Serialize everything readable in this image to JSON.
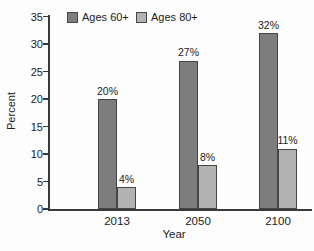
{
  "chart_data": {
    "type": "bar",
    "title": "",
    "xlabel": "Year",
    "ylabel": "Percent",
    "categories": [
      "2013",
      "2050",
      "2100"
    ],
    "series": [
      {
        "name": "Ages 60+",
        "values": [
          20,
          27,
          32
        ],
        "labels": [
          "20%",
          "27%",
          "32%"
        ],
        "color": "#7d7d7d"
      },
      {
        "name": "Ages 80+",
        "values": [
          4,
          8,
          11
        ],
        "labels": [
          "4%",
          "8%",
          "11%"
        ],
        "color": "#b2b2b2"
      }
    ],
    "ylim": [
      0,
      35
    ],
    "yticks": [
      0,
      5,
      10,
      15,
      20,
      25,
      30,
      35
    ],
    "grid": false,
    "legend_position": "top-left",
    "bar_border_color": "#454545",
    "axis_color": "#3a3a3a",
    "text_color": "#222222"
  }
}
